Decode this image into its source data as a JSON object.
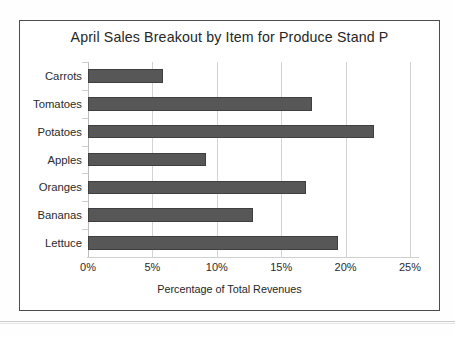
{
  "figure": {
    "title": "April Sales Breakout by Item for Produce Stand P",
    "frame_color": "#4c4c4c",
    "background": "#ffffff"
  },
  "chart_data": {
    "type": "bar",
    "orientation": "horizontal",
    "title": "April Sales Breakout by Item for Produce Stand P",
    "xlabel": "Percentage of Total Revenues",
    "ylabel": "",
    "categories": [
      "Carrots",
      "Tomatoes",
      "Potatoes",
      "Apples",
      "Oranges",
      "Bananas",
      "Lettuce"
    ],
    "values": [
      5.8,
      17.4,
      22.2,
      9.2,
      16.9,
      12.8,
      19.4
    ],
    "value_unit": "%",
    "xlim": [
      0,
      25
    ],
    "xticks": [
      0,
      5,
      10,
      15,
      20,
      25
    ],
    "xtick_labels": [
      "0%",
      "5%",
      "10%",
      "15%",
      "20%",
      "25%"
    ],
    "grid": "vertical",
    "legend": null,
    "bar_color": "#575757",
    "bar_edge_color": "#3f3f3f",
    "gridline_color": "#d3d3d3"
  }
}
